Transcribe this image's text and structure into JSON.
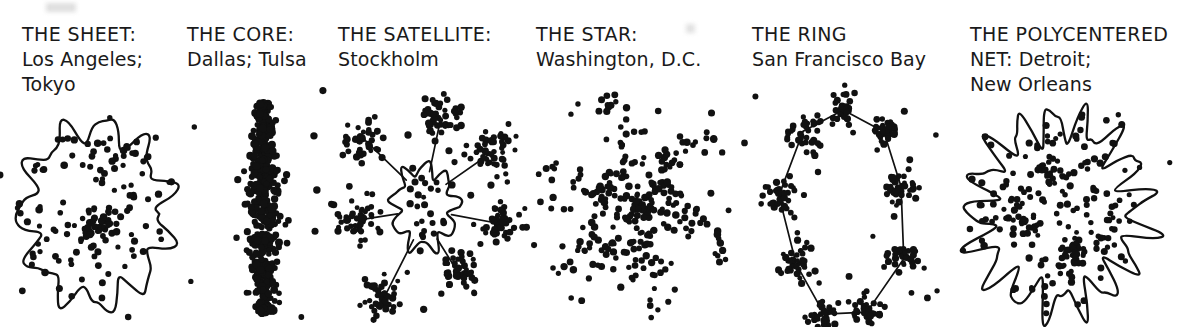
{
  "figure": {
    "background_color": "#ffffff",
    "ink_color": "#111111",
    "width": 1193,
    "height": 327
  },
  "panels": [
    {
      "id": "sheet",
      "type_label": "THE SHEET:",
      "examples_label": "Los Angeles;\nTokyo",
      "caption_x": 22,
      "diagram": {
        "kind": "blob-scatter",
        "x": 12,
        "y": 112,
        "width": 185,
        "height": 208,
        "outline": true,
        "dot_radius": 3.1,
        "seed": 17,
        "interior_points": 96,
        "outlier_points": 12,
        "cores": [
          {
            "cx": 0.46,
            "cy": 0.55,
            "r": 0.1,
            "n": 46
          }
        ],
        "blob": {
          "cx": 0.45,
          "cy": 0.49,
          "rx": 0.39,
          "ry": 0.42,
          "lobes": 11,
          "wobble": 0.16
        }
      }
    },
    {
      "id": "core",
      "type_label": "THE CORE:",
      "examples_label": "Dallas; Tulsa",
      "caption_x": 187,
      "diagram": {
        "kind": "dense-spindle",
        "x": 210,
        "y": 96,
        "width": 118,
        "height": 226,
        "outline": false,
        "dot_radius": 3.3,
        "seed": 42,
        "interior_points": 470,
        "outlier_points": 10,
        "cores": [],
        "spindle": {
          "cx": 0.46,
          "cy": 0.5,
          "rx": 0.17,
          "ry": 0.47
        }
      }
    },
    {
      "id": "satellite",
      "type_label": "THE SATELLITE:",
      "examples_label": "Stockholm",
      "caption_x": 338,
      "diagram": {
        "kind": "hub-and-spoke",
        "x": 340,
        "y": 96,
        "width": 180,
        "height": 222,
        "outline": true,
        "dot_radius": 3.0,
        "seed": 91,
        "interior_points": 22,
        "outlier_points": 16,
        "blob": {
          "cx": 0.47,
          "cy": 0.5,
          "rx": 0.17,
          "ry": 0.18,
          "lobes": 9,
          "wobble": 0.2
        },
        "satellites": [
          {
            "cx": 0.56,
            "cy": 0.1,
            "r": 0.1,
            "n": 48
          },
          {
            "cx": 0.85,
            "cy": 0.25,
            "r": 0.1,
            "n": 44
          },
          {
            "cx": 0.92,
            "cy": 0.58,
            "r": 0.09,
            "n": 40
          },
          {
            "cx": 0.66,
            "cy": 0.8,
            "r": 0.09,
            "n": 40
          },
          {
            "cx": 0.25,
            "cy": 0.9,
            "r": 0.09,
            "n": 42
          },
          {
            "cx": 0.09,
            "cy": 0.56,
            "r": 0.1,
            "n": 46
          },
          {
            "cx": 0.14,
            "cy": 0.2,
            "r": 0.09,
            "n": 40
          }
        ]
      }
    },
    {
      "id": "star",
      "type_label": "THE STAR:",
      "examples_label": "Washington, D.C.",
      "caption_x": 536,
      "diagram": {
        "kind": "star-arms",
        "x": 552,
        "y": 112,
        "width": 165,
        "height": 190,
        "outline": false,
        "dot_radius": 3.1,
        "seed": 7,
        "interior_points": 70,
        "outlier_points": 10,
        "cores": [
          {
            "cx": 0.5,
            "cy": 0.5,
            "r": 0.13,
            "n": 54
          }
        ],
        "arms": {
          "count": 6,
          "per_arm": 26,
          "length": 0.46,
          "spread": 0.075,
          "rotation": 18
        }
      }
    },
    {
      "id": "ring",
      "type_label": "THE RING",
      "examples_label": "San Francisco Bay",
      "caption_x": 752,
      "diagram": {
        "kind": "ring-network",
        "x": 758,
        "y": 92,
        "width": 175,
        "height": 235,
        "outline": false,
        "dot_radius": 3.0,
        "seed": 55,
        "interior_points": 0,
        "outlier_points": 22,
        "ring": {
          "cx": 0.5,
          "cy": 0.5,
          "rx": 0.36,
          "ry": 0.44,
          "nodes": 9,
          "per_node": 34,
          "node_r": 0.075,
          "rotation": -12
        }
      }
    },
    {
      "id": "polycentered-net",
      "type_label": "THE POLYCENTERED",
      "examples_label": "NET: Detroit;\nNew Orleans",
      "caption_x": 970,
      "diagram": {
        "kind": "blob-scatter",
        "x": 962,
        "y": 110,
        "width": 205,
        "height": 205,
        "outline": true,
        "dot_radius": 3.0,
        "seed": 123,
        "interior_points": 150,
        "outlier_points": 5,
        "cores": [
          {
            "cx": 0.43,
            "cy": 0.3,
            "r": 0.065,
            "n": 22
          },
          {
            "cx": 0.31,
            "cy": 0.52,
            "r": 0.07,
            "n": 24
          },
          {
            "cx": 0.55,
            "cy": 0.72,
            "r": 0.07,
            "n": 24
          }
        ],
        "blob": {
          "cx": 0.47,
          "cy": 0.5,
          "rx": 0.4,
          "ry": 0.44,
          "lobes": 17,
          "wobble": 0.22
        }
      }
    }
  ]
}
